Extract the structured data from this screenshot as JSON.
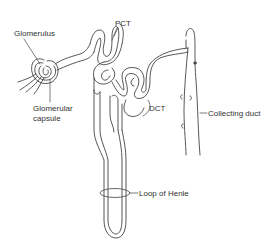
{
  "diagram": {
    "labels": {
      "glomerulus": "Glomerulus",
      "glomerular_capsule_line1": "Glomerular",
      "glomerular_capsule_line2": "capsule",
      "pct": "PCT",
      "dct": "DCT",
      "collecting_duct": "Collecting duct",
      "loop_of_henle": "Loop of Henle"
    },
    "colors": {
      "line": "#444444",
      "text": "#333333",
      "background": "#ffffff"
    }
  }
}
